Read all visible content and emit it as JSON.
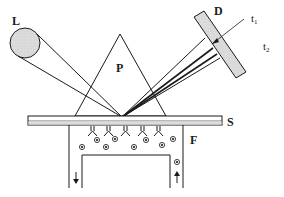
{
  "diagram": {
    "type": "surface-plasmon-resonance-setup",
    "labels": {
      "light_source": "L",
      "prism": "P",
      "detector": "D",
      "slide": "S",
      "flow_cell": "F",
      "t1": "t",
      "t1_sub": "1",
      "t2": "t",
      "t2_sub": "2"
    },
    "colors": {
      "line": "#1a1a1a",
      "fill_gray": "#d8d8d8",
      "background": "#ffffff"
    },
    "flow": {
      "inlet_direction": "up",
      "outlet_direction": "down"
    }
  }
}
